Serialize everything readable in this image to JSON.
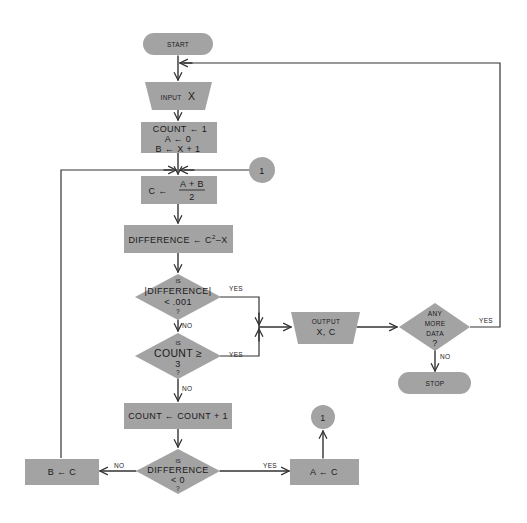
{
  "colors": {
    "shape_fill": "#a3a3a3",
    "line": "#333333",
    "background": "#ffffff"
  },
  "nodes": {
    "start": {
      "label": "START",
      "shape": "terminal"
    },
    "input": {
      "label_small": "INPUT",
      "label_big": "X",
      "shape": "input-trapezoid"
    },
    "init": {
      "lines": [
        "COUNT ← 1",
        "A ← 0",
        "B ← X + 1"
      ],
      "shape": "process"
    },
    "connector_top": {
      "label": "1",
      "shape": "connector"
    },
    "compute_c": {
      "left": "C ←",
      "numerator": "A + B",
      "denominator": "2",
      "shape": "process"
    },
    "difference": {
      "label": "DIFFERENCE ← C",
      "superscript": "2",
      "suffix": "–X",
      "shape": "process"
    },
    "decision_small_diff": {
      "lines": [
        "IS",
        "|DIFFERENCE|",
        "< .001",
        "?"
      ],
      "shape": "decision"
    },
    "decision_count": {
      "lines": [
        "IS",
        "COUNT ≥",
        "3",
        "?"
      ],
      "shape": "decision"
    },
    "output": {
      "lines": [
        "OUTPUT",
        "X, C"
      ],
      "shape": "output-trapezoid"
    },
    "decision_more_data": {
      "lines": [
        "ANY",
        "MORE",
        "DATA",
        "?"
      ],
      "shape": "decision"
    },
    "stop": {
      "label": "STOP",
      "shape": "terminal"
    },
    "increment": {
      "label": "COUNT ← COUNT + 1",
      "shape": "process"
    },
    "decision_negative": {
      "lines": [
        "IS",
        "DIFFERENCE",
        "< 0",
        "?"
      ],
      "shape": "decision"
    },
    "b_assign": {
      "label": "B ← C",
      "shape": "process"
    },
    "a_assign": {
      "label": "A ← C",
      "shape": "process"
    },
    "connector_bottom": {
      "label": "1",
      "shape": "connector"
    }
  },
  "edge_labels": {
    "diff_yes": "YES",
    "diff_no": "NO",
    "count_yes": "YES",
    "count_no": "NO",
    "more_yes": "YES",
    "more_no": "NO",
    "neg_no": "NO",
    "neg_yes": "YES"
  }
}
